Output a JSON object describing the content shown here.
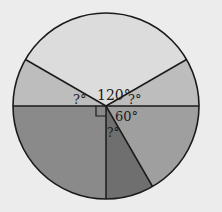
{
  "diagram": {
    "type": "pie-angle-diagram",
    "background": "#ececec",
    "circle": {
      "cx": 106,
      "cy": 106,
      "r": 93,
      "stroke": "#1a1a1a"
    },
    "sectors": [
      {
        "name": "top-sector",
        "start_deg": 30,
        "end_deg": 150,
        "fill": "#dcdcdc",
        "label": "120°"
      },
      {
        "name": "upper-left-sector",
        "start_deg": 150,
        "end_deg": 180,
        "fill": "#bdbdbd",
        "label": "?°"
      },
      {
        "name": "lower-left-sector",
        "start_deg": 180,
        "end_deg": 270,
        "fill": "#8a8a8a",
        "label": ""
      },
      {
        "name": "bottom-narrow-sector",
        "start_deg": 270,
        "end_deg": 300,
        "fill": "#6f6f6f",
        "label": "?°"
      },
      {
        "name": "lower-right-sector",
        "start_deg": 300,
        "end_deg": 360,
        "fill": "#9f9f9f",
        "label": "60°"
      },
      {
        "name": "upper-right-sector",
        "start_deg": 0,
        "end_deg": 30,
        "fill": "#bdbdbd",
        "label": "?°"
      }
    ],
    "labels": {
      "top": "120°",
      "upper_left": "?°",
      "upper_right": "?°",
      "lower_right": "60°",
      "bottom_narrow": "?°"
    },
    "right_angle_marker": true
  }
}
